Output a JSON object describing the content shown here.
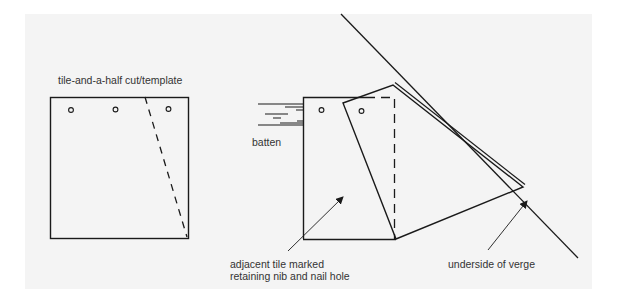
{
  "figure": {
    "background_color": "#f4f4f4",
    "line_color": "#1a1a1a",
    "labels": {
      "template": "tile-and-a-half cut/template",
      "batten": "batten",
      "adjacent_tile_line1": "adjacent tile marked",
      "adjacent_tile_line2": "retaining nib and nail hole",
      "verge": "underside of verge"
    }
  }
}
